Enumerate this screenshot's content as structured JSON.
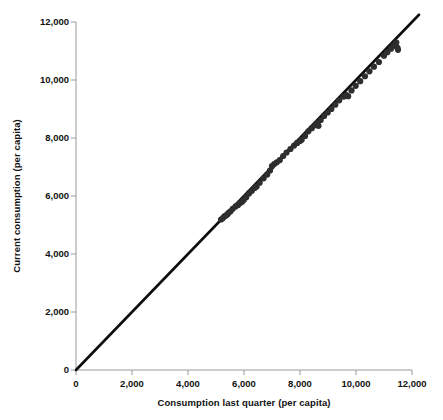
{
  "chart_data": {
    "type": "scatter",
    "title": "",
    "subtitle": "",
    "xlabel": "Consumption last quarter (per capita)",
    "ylabel": "Current consumption (per capita)",
    "xlim": [
      0,
      12000
    ],
    "ylim": [
      0,
      12000
    ],
    "grid": false,
    "legend": "none",
    "xticks": [
      0,
      2000,
      4000,
      6000,
      8000,
      10000,
      12000
    ],
    "yticks": [
      0,
      2000,
      4000,
      6000,
      8000,
      10000,
      12000
    ],
    "xticklabels": [
      "0",
      "2,000",
      "4,000",
      "6,000",
      "8,000",
      "10,000",
      "12,000"
    ],
    "yticklabels": [
      "0",
      "2,000",
      "4,000",
      "6,000",
      "8,000",
      "10,000",
      "12,000"
    ],
    "marker_color": "#2e2e2e",
    "line_color": "#0d0d0d",
    "axis_color": "#9a9a9a",
    "background_color": "#ffffff",
    "series": [
      {
        "name": "Households",
        "marker": "circle",
        "points": [
          [
            5180,
            5190
          ],
          [
            5250,
            5240
          ],
          [
            5300,
            5300
          ],
          [
            5360,
            5330
          ],
          [
            5410,
            5370
          ],
          [
            5450,
            5420
          ],
          [
            5520,
            5470
          ],
          [
            5600,
            5560
          ],
          [
            5700,
            5640
          ],
          [
            5790,
            5690
          ],
          [
            5860,
            5760
          ],
          [
            5930,
            5800
          ],
          [
            5990,
            5860
          ],
          [
            6080,
            5960
          ],
          [
            6180,
            6090
          ],
          [
            6280,
            6180
          ],
          [
            6380,
            6280
          ],
          [
            6450,
            6330
          ],
          [
            6560,
            6460
          ],
          [
            6700,
            6610
          ],
          [
            6830,
            6740
          ],
          [
            6930,
            6880
          ],
          [
            7000,
            7030
          ],
          [
            7080,
            7100
          ],
          [
            7170,
            7160
          ],
          [
            7280,
            7240
          ],
          [
            7400,
            7380
          ],
          [
            7520,
            7500
          ],
          [
            7660,
            7620
          ],
          [
            7790,
            7740
          ],
          [
            7900,
            7830
          ],
          [
            8000,
            7900
          ],
          [
            8060,
            7940
          ],
          [
            8180,
            8070
          ],
          [
            8300,
            8230
          ],
          [
            8420,
            8340
          ],
          [
            8540,
            8440
          ],
          [
            8620,
            8520
          ],
          [
            8660,
            8420
          ],
          [
            8740,
            8620
          ],
          [
            8860,
            8760
          ],
          [
            8990,
            8880
          ],
          [
            9120,
            9000
          ],
          [
            9260,
            9150
          ],
          [
            9400,
            9300
          ],
          [
            9560,
            9430
          ],
          [
            9660,
            9480
          ],
          [
            9720,
            9440
          ],
          [
            9840,
            9640
          ],
          [
            9990,
            9800
          ],
          [
            10150,
            9960
          ],
          [
            10320,
            10130
          ],
          [
            10480,
            10300
          ],
          [
            10640,
            10460
          ],
          [
            10820,
            10620
          ],
          [
            11000,
            10840
          ],
          [
            11120,
            10960
          ],
          [
            11250,
            11080
          ],
          [
            11340,
            11180
          ],
          [
            11400,
            11230
          ],
          [
            11440,
            11290
          ],
          [
            11480,
            11110
          ],
          [
            11500,
            11040
          ]
        ]
      }
    ],
    "fit_line": {
      "name": "Identity / regression line",
      "slope": 1.0,
      "intercept": 0,
      "x_start": 0,
      "x_end": 12250,
      "y_start": 0,
      "y_end": 12250
    }
  },
  "axes": {
    "y_title": "Current consumption (per capita)",
    "x_title": "Consumption last quarter (per capita)",
    "y_labels": [
      "12,000",
      "10,000",
      "8,000",
      "6,000",
      "4,000",
      "2,000",
      "0"
    ],
    "x_labels": [
      "0",
      "2,000",
      "4,000",
      "6,000",
      "8,000",
      "10,000",
      "12,000"
    ]
  }
}
